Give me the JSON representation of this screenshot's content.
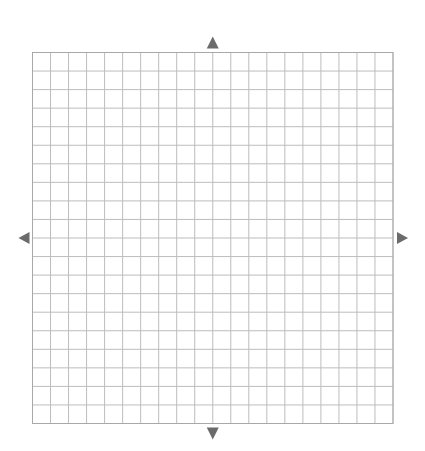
{
  "diagram": {
    "type": "coordinate-grid",
    "columns": 20,
    "rows": 20,
    "grid": {
      "left": 32.5,
      "top": 52.5,
      "right": 393,
      "bottom": 423.5
    },
    "axis_arrows": [
      "up",
      "down",
      "left",
      "right"
    ],
    "colors": {
      "background": "#ffffff",
      "grid_line": "#bdbdbd",
      "grid_border": "#a8a8a8",
      "arrow": "#6b6b6b"
    }
  }
}
